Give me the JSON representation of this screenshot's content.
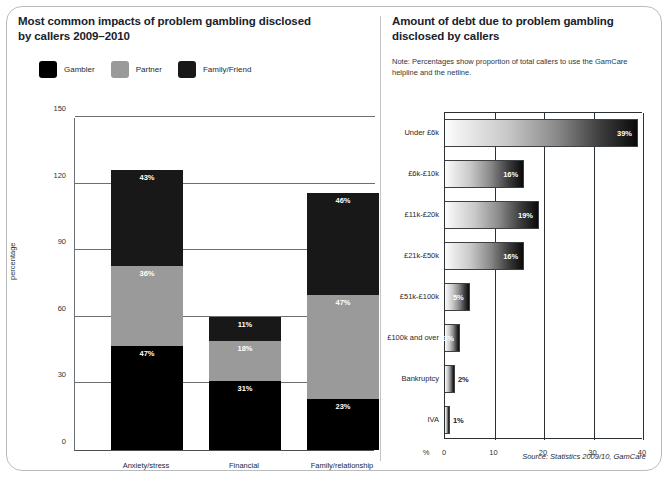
{
  "left_panel": {
    "title_line1": "Most common impacts of problem gambling disclosed",
    "title_line2": "by callers 2009–2010",
    "legend": [
      {
        "label": "Gambler",
        "color": "#000000",
        "key": "gambler"
      },
      {
        "label": "Partner",
        "color": "#9a9a9a",
        "key": "partner"
      },
      {
        "label": "Family/Friend",
        "color": "#181818",
        "key": "family_friend"
      }
    ],
    "ylabel": "percentage"
  },
  "right_panel": {
    "title_line1": "Amount of debt due to problem gambling",
    "title_line2": "disclosed by callers",
    "note": "Note: Percentages show proportion of total callers to use the GamCare helpline and the netline.",
    "axis_prefix": "%"
  },
  "source": "Source: Statistics 2009/10, GamCare",
  "chart_data": [
    {
      "type": "bar",
      "id": "impacts-stacked-bar",
      "stacked": true,
      "title": "Most common impacts of problem gambling disclosed by callers 2009–2010",
      "xlabel": "",
      "ylabel": "percentage",
      "ylim": [
        0,
        150
      ],
      "yticks": [
        0,
        30,
        60,
        90,
        120,
        150
      ],
      "grid": true,
      "legend_position": "top-left",
      "categories": [
        "Anxiety/stress",
        "Financial",
        "Family/relationship"
      ],
      "series": [
        {
          "name": "Gambler",
          "color": "#000000",
          "values": [
            47,
            31,
            23
          ],
          "labels": [
            "47%",
            "31%",
            "23%"
          ]
        },
        {
          "name": "Partner",
          "color": "#9a9a9a",
          "values": [
            36,
            18,
            47
          ],
          "labels": [
            "36%",
            "18%",
            "47%"
          ]
        },
        {
          "name": "Family/Friend",
          "color": "#181818",
          "values": [
            43,
            11,
            46
          ],
          "labels": [
            "43%",
            "11%",
            "46%"
          ]
        }
      ],
      "totals": [
        126,
        60,
        116
      ]
    },
    {
      "type": "bar",
      "id": "debt-horizontal-bar",
      "orientation": "horizontal",
      "title": "Amount of debt due to problem gambling disclosed by callers",
      "xlabel": "%",
      "ylabel": "",
      "xlim": [
        0,
        40
      ],
      "xticks": [
        0,
        10,
        20,
        30,
        40
      ],
      "grid": true,
      "gradient_fill": "white-to-black left-to-right",
      "categories": [
        "Under £6k",
        "£6k-£10k",
        "£11k-£20k",
        "£21k-£50k",
        "£51k-£100k",
        "£100k and over",
        "Bankruptcy",
        "IVA"
      ],
      "values": [
        39,
        16,
        19,
        16,
        5,
        3,
        2,
        1
      ],
      "labels": [
        "39%",
        "16%",
        "19%",
        "16%",
        "5%",
        "3%",
        "2%",
        "1%"
      ],
      "label_placement": [
        "inside",
        "inside",
        "inside",
        "inside",
        "inside",
        "inside",
        "outside",
        "outside"
      ]
    }
  ]
}
